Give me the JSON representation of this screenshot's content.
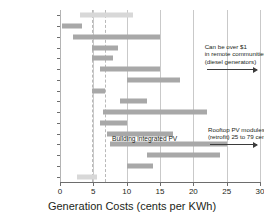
{
  "chart_data": {
    "type": "bar",
    "orientation": "horizontal",
    "title": "",
    "xlabel": "Generation Costs (cents per KWh)",
    "ylabel": "",
    "xlim": [
      0,
      30
    ],
    "xticks": [
      0,
      5,
      10,
      15,
      20,
      25,
      30
    ],
    "grid": true,
    "legend": null,
    "categories": [
      "Reservoir Hydro",
      "Capacity Increases",
      "Run of River Hydro",
      "Nuclear",
      "Natural Gas",
      "Oil",
      "Diesel",
      "Coal",
      "ERG",
      "Biomass",
      "Geothermal",
      "Wind",
      "Solar PV",
      "Tidal",
      "Wave",
      "DSM"
    ],
    "ranges": [
      {
        "category": "Reservoir Hydro",
        "low": 3.0,
        "high": 11.0,
        "shade": "light"
      },
      {
        "category": "Capacity Increases",
        "low": 0.3,
        "high": 3.3,
        "shade": "normal"
      },
      {
        "category": "Run of River Hydro",
        "low": 2.0,
        "high": 15.0,
        "shade": "normal"
      },
      {
        "category": "Nuclear",
        "low": 4.8,
        "high": 8.7,
        "shade": "normal"
      },
      {
        "category": "Natural Gas",
        "low": 4.8,
        "high": 8.0,
        "shade": "normal"
      },
      {
        "category": "Oil",
        "low": 6.0,
        "high": 15.0,
        "shade": "normal"
      },
      {
        "category": "Diesel",
        "low": 10.0,
        "high": 18.0,
        "shade": "normal"
      },
      {
        "category": "Coal",
        "low": 4.8,
        "high": 6.8,
        "shade": "normal"
      },
      {
        "category": "ERG",
        "low": 9.0,
        "high": 13.0,
        "shade": "normal"
      },
      {
        "category": "Biomass",
        "low": 6.5,
        "high": 22.0,
        "shade": "normal"
      },
      {
        "category": "Geothermal",
        "low": 6.0,
        "high": 10.0,
        "shade": "normal"
      },
      {
        "category": "Wind",
        "low": 7.0,
        "high": 17.0,
        "shade": "normal"
      },
      {
        "category": "Solar PV",
        "low": 7.5,
        "high": 25.0,
        "shade": "normal"
      },
      {
        "category": "Tidal",
        "low": 13.0,
        "high": 24.0,
        "shade": "normal"
      },
      {
        "category": "Wave",
        "low": 10.0,
        "high": 14.0,
        "shade": "normal"
      },
      {
        "category": "DSM",
        "low": 2.5,
        "high": 5.5,
        "shade": "light"
      }
    ],
    "annotations": [
      {
        "id": "oil-diesel-note",
        "text_lines": [
          "Can be over $1",
          "in remote communities",
          "(diesel generators)"
        ],
        "points_to": "Oil",
        "arrow_from": 22.0,
        "arrow_to": 29.5
      },
      {
        "id": "rooftop-pv-note",
        "text_lines": [
          "Rooftop PV modules",
          "(retrofit) 25 to 79 cents"
        ],
        "points_to": "Solar PV",
        "arrow_from": 22.5,
        "arrow_to": 29.5
      },
      {
        "id": "building-integrated-pv-note",
        "text_lines": [
          "Building integrated PV"
        ],
        "points_to": "Solar PV",
        "inline_at": 7.8
      }
    ],
    "colors": {
      "bar": "#a8a8a8",
      "bar_light": "#d8d8d8",
      "grid": "#c9c9c9",
      "axis": "#6d6d6d",
      "text": "#231f20"
    }
  }
}
